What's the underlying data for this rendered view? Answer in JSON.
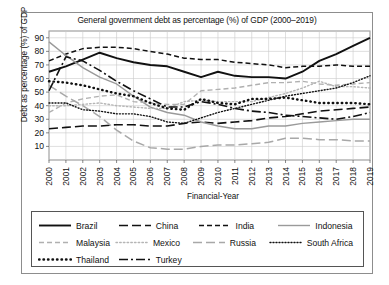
{
  "chart_data": {
    "type": "line",
    "title": "General government debt as percentage (%) of GDP (2000–2019)",
    "xlabel": "Financial-Year",
    "ylabel": "Debt as percentage (%) of GDP",
    "grid": true,
    "legend_position": "bottom",
    "xlim": [
      2000,
      2019
    ],
    "ylim": [
      0,
      95
    ],
    "yticks": [
      10,
      20,
      30,
      40,
      50,
      60,
      70,
      80,
      90
    ],
    "categories": [
      "2000",
      "2001",
      "2002",
      "2003",
      "2004",
      "2005",
      "2006",
      "2007",
      "2008",
      "2009",
      "2010",
      "2011",
      "2012",
      "2013",
      "2014",
      "2015",
      "2016",
      "2017",
      "2018",
      "2019"
    ],
    "series": [
      {
        "name": "Brazil",
        "style": "solid",
        "color": "#111111",
        "width": 1.9,
        "dash": "none",
        "values": [
          65,
          69,
          74,
          79,
          75,
          72,
          70,
          69,
          65,
          61,
          65,
          62,
          61,
          61,
          60,
          65,
          73,
          78,
          84,
          90
        ]
      },
      {
        "name": "China",
        "style": "long-dash",
        "color": "#111111",
        "width": 1.6,
        "dash": "9,4",
        "values": [
          23,
          24,
          25,
          25,
          26,
          26,
          25,
          25,
          27,
          28,
          27,
          28,
          29,
          31,
          32,
          34,
          36,
          37,
          38,
          39
        ]
      },
      {
        "name": "India",
        "style": "dash",
        "color": "#111111",
        "width": 1.5,
        "dash": "5,3",
        "values": [
          73,
          78,
          82,
          83,
          83,
          82,
          80,
          78,
          75,
          74,
          74,
          72,
          71,
          70,
          68,
          69,
          69,
          70,
          69,
          69
        ]
      },
      {
        "name": "Indonesia",
        "style": "solid-thin",
        "color": "#9a9a9a",
        "width": 1.4,
        "dash": "none",
        "values": [
          87,
          77,
          68,
          61,
          56,
          47,
          39,
          35,
          33,
          28,
          25,
          23,
          23,
          25,
          25,
          27,
          28,
          29,
          30,
          30
        ]
      },
      {
        "name": "Malaysia",
        "style": "dash-light",
        "color": "#b0b0b0",
        "width": 1.4,
        "dash": "5,3",
        "values": [
          35,
          42,
          45,
          47,
          48,
          43,
          42,
          41,
          41,
          51,
          52,
          53,
          55,
          57,
          57,
          58,
          56,
          55,
          56,
          57
        ]
      },
      {
        "name": "Mexico",
        "style": "dot-light",
        "color": "#b5b5b5",
        "width": 1.4,
        "dash": "1.5,2.2",
        "values": [
          40,
          40,
          41,
          42,
          40,
          39,
          38,
          38,
          43,
          44,
          43,
          43,
          43,
          46,
          49,
          53,
          58,
          54,
          54,
          53
        ]
      },
      {
        "name": "Russia",
        "style": "long-dash-gray",
        "color": "#a8a8a8",
        "width": 1.5,
        "dash": "9,4",
        "values": [
          55,
          47,
          40,
          32,
          22,
          14,
          9,
          8,
          8,
          10,
          11,
          11,
          12,
          13,
          16,
          16,
          15,
          15,
          14,
          14
        ]
      },
      {
        "name": "South Africa",
        "style": "fine-dot",
        "color": "#111111",
        "width": 1.4,
        "dash": "1,2",
        "values": [
          42,
          42,
          37,
          36,
          34,
          34,
          32,
          28,
          27,
          31,
          35,
          38,
          41,
          44,
          47,
          49,
          51,
          53,
          57,
          62
        ]
      },
      {
        "name": "Thailand",
        "style": "thick-dot",
        "color": "#111111",
        "width": 2.4,
        "dash": "0.5,4",
        "values": [
          58,
          57,
          55,
          52,
          49,
          47,
          42,
          38,
          37,
          45,
          42,
          41,
          45,
          45,
          46,
          44,
          42,
          42,
          42,
          41
        ]
      },
      {
        "name": "Turkey",
        "style": "dash-dot",
        "color": "#111111",
        "width": 1.6,
        "dash": "9,3,2,3",
        "values": [
          51,
          76,
          73,
          66,
          58,
          51,
          45,
          39,
          39,
          43,
          41,
          38,
          36,
          35,
          33,
          32,
          31,
          30,
          32,
          35
        ]
      }
    ]
  },
  "legend": {
    "rows": [
      [
        "Brazil",
        "China",
        "India",
        "Indonesia"
      ],
      [
        "Malaysia",
        "Mexico",
        "Russia",
        "South Africa"
      ],
      [
        "Thailand",
        "Turkey"
      ]
    ]
  }
}
